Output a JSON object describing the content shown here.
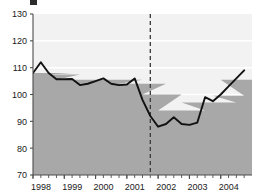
{
  "chart_data": {
    "type": "line",
    "title": "",
    "subtitle": "",
    "xlabel": "",
    "ylabel": "",
    "ylim": [
      70,
      130
    ],
    "yticks": [
      70,
      80,
      90,
      100,
      110,
      120,
      130
    ],
    "xlim": [
      "1998.0",
      "2004.75"
    ],
    "xticks": [
      1998,
      1999,
      2000,
      2001,
      2002,
      2003,
      2004
    ],
    "xticklabels": [
      "1998",
      "1999",
      "2000",
      "2001",
      "2002",
      "2003",
      "2004"
    ],
    "tick_frequency": "quarterly",
    "grid": "horizontal white gridlines on light gray panel",
    "legend": "none",
    "x": [
      1998.0,
      1998.25,
      1998.5,
      1998.75,
      1999.0,
      1999.25,
      1999.5,
      1999.75,
      2000.0,
      2000.25,
      2000.5,
      2000.75,
      2001.0,
      2001.25,
      2001.5,
      2001.75,
      2002.0,
      2002.25,
      2002.5,
      2002.75,
      2003.0,
      2003.25,
      2003.5,
      2003.75,
      2004.0,
      2004.25,
      2004.5,
      2004.75
    ],
    "series": [
      {
        "name": "index",
        "values": [
          108.0,
          112.0,
          108.0,
          105.7,
          105.7,
          105.8,
          103.5,
          104.0,
          105.0,
          106.0,
          104.0,
          103.5,
          103.7,
          106.0,
          98.0,
          92.0,
          88.0,
          89.0,
          91.5,
          89.0,
          88.7,
          89.5,
          99.0,
          97.5,
          100.0,
          103.0,
          106.0,
          109.0
        ]
      }
    ],
    "area_series": {
      "name": "shaded-band",
      "type": "step-area",
      "values": [
        108.0,
        108.0,
        107.5,
        105.5,
        105.5,
        105.5,
        105.5,
        105.5,
        105.5,
        105.5,
        105.5,
        104.0,
        104.0,
        104.0,
        100.0,
        100.0,
        94.0,
        94.0,
        94.0,
        97.0,
        97.0,
        97.0,
        97.0,
        99.5,
        105.5,
        105.5,
        105.5,
        105.5
      ]
    },
    "annotations": [
      {
        "name": "vertical-dashed-marker",
        "type": "vline",
        "x": 2001.75,
        "style": "dashed",
        "label": ""
      }
    ],
    "colors": {
      "line": "#111111",
      "area_fill": "#a8a8a8",
      "panel_background": "#f2f2f2",
      "gridline": "#ffffff",
      "axis": "#4d4d4d",
      "tick_label": "#1a1a1a"
    }
  }
}
